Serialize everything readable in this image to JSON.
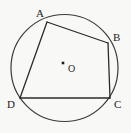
{
  "figure": {
    "canvas": {
      "width": 131,
      "height": 133,
      "background": "#f8f8f7"
    },
    "colors": {
      "stroke": "#2b2b2b",
      "circle_stroke": "#3a3a3a",
      "label_color": "#1b1b1b",
      "center_dot": "#1b1b1b"
    },
    "circle": {
      "name": "circumscribed-circle",
      "cx": 64.5,
      "cy": 68,
      "r": 53.5,
      "stroke_width": 1.2
    },
    "center": {
      "label": "O",
      "dot_x": 63,
      "dot_y": 63,
      "dot_size": 2.6,
      "label_x": 68,
      "label_y": 64
    },
    "vertices": [
      {
        "id": "A",
        "label": "A",
        "x": 47,
        "y": 22,
        "label_x": 36,
        "label_y": 8
      },
      {
        "id": "B",
        "label": "B",
        "x": 108,
        "y": 43,
        "label_x": 113,
        "label_y": 32
      },
      {
        "id": "C",
        "label": "C",
        "x": 110,
        "y": 98,
        "label_x": 114,
        "label_y": 99
      },
      {
        "id": "D",
        "label": "D",
        "x": 20,
        "y": 98,
        "label_x": 7,
        "label_y": 99
      }
    ],
    "edges": [
      {
        "id": "AB",
        "from": "A",
        "to": "B",
        "x1": 47,
        "y1": 22,
        "x2": 108,
        "y2": 43
      },
      {
        "id": "BC",
        "from": "B",
        "to": "C",
        "x1": 108,
        "y1": 43,
        "x2": 110,
        "y2": 98
      },
      {
        "id": "CD",
        "from": "C",
        "to": "D",
        "x1": 110,
        "y1": 98,
        "x2": 20,
        "y2": 98
      },
      {
        "id": "DA",
        "from": "D",
        "to": "A",
        "x1": 20,
        "y1": 98,
        "x2": 47,
        "y2": 22
      }
    ]
  }
}
